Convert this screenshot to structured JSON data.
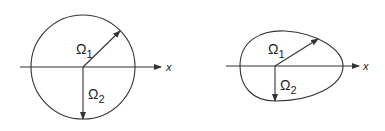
{
  "figures": [
    {
      "name": "circle",
      "shape": "circle",
      "labels": {
        "omega1": "Ω",
        "omega1_sub": "1",
        "omega2": "Ω",
        "omega2_sub": "2",
        "axis": "x"
      }
    },
    {
      "name": "egg",
      "shape": "egg-shaped closed curve",
      "labels": {
        "omega1": "Ω",
        "omega1_sub": "1",
        "omega2": "Ω",
        "omega2_sub": "2",
        "axis": "x"
      }
    }
  ],
  "colors": {
    "stroke": "#333333",
    "background": "#ffffff"
  }
}
